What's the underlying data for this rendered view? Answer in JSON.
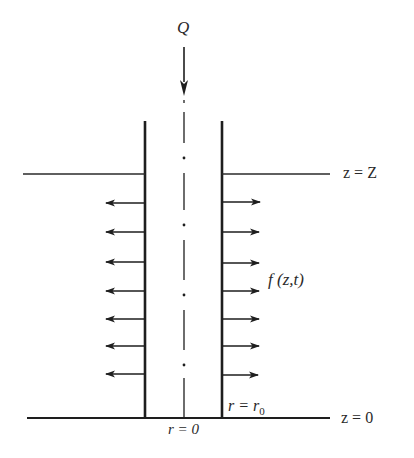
{
  "diagram": {
    "labels": {
      "inflow": "Q",
      "top_level": "z = Z",
      "bottom_level": "z = 0",
      "lateral_flux": "f (z,t)",
      "wall_radius_prefix": "r = r",
      "wall_radius_sub": "0",
      "axis_radius": "r = 0"
    },
    "geometry": {
      "left_wall_x": 145,
      "right_wall_x": 222,
      "axis_x": 184,
      "wall_top_y": 121,
      "top_surface_y": 174,
      "bottom_surface_y": 418,
      "arrow_rows_y": [
        203,
        232,
        262,
        291,
        319,
        346,
        374
      ]
    },
    "colors": {
      "line": "#1e1e1e",
      "text": "#2a2a2a",
      "background": "#ffffff"
    }
  }
}
